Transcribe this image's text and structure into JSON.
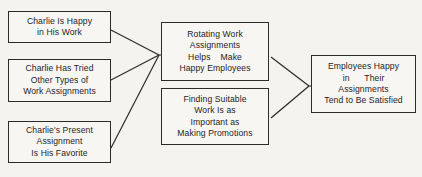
{
  "diagram": {
    "type": "flow-diagram",
    "title": "",
    "background_color": "#f4f3ef",
    "line_color": "#2b2b2b",
    "text_color": "#1d1d1d",
    "partial_top_text": "· · · · · ·",
    "nodes": [
      {
        "id": "evidence-1",
        "group": "evidence",
        "lines": [
          "Charlie Is Happy",
          "in His Work"
        ],
        "x": 8,
        "y": 11,
        "w": 103,
        "h": 32
      },
      {
        "id": "evidence-2",
        "group": "evidence",
        "lines": [
          "Charlie Has Tried",
          "Other Types of",
          "Work Assignments"
        ],
        "x": 8,
        "y": 59,
        "w": 103,
        "h": 43
      },
      {
        "id": "evidence-3",
        "group": "evidence",
        "lines": [
          "Charlie's Present",
          "Assignment",
          "Is His Favorite"
        ],
        "x": 8,
        "y": 121,
        "w": 103,
        "h": 42
      },
      {
        "id": "generalization-1",
        "group": "generalization",
        "lines": [
          "Rotating Work",
          "Assignments",
          "Helps    Make",
          "Happy Employees"
        ],
        "x": 161,
        "y": 22,
        "w": 108,
        "h": 59
      },
      {
        "id": "generalization-2",
        "group": "generalization",
        "lines": [
          "Finding Suitable",
          "Work Is as",
          "Important as",
          "Making Promotions"
        ],
        "x": 161,
        "y": 88,
        "w": 108,
        "h": 57
      },
      {
        "id": "conclusion",
        "group": "conclusion",
        "lines": [
          "Employees Happy",
          "in      Their",
          "Assignments",
          "Tend to Be Satisfied"
        ],
        "x": 311,
        "y": 55,
        "w": 105,
        "h": 58
      }
    ],
    "connectors": [
      {
        "id": "evidence1-to-junction-left",
        "from": "evidence-1",
        "to": "junction-left",
        "x1": 111,
        "y1": 30,
        "x2": 159,
        "y2": 55
      },
      {
        "id": "evidence2-to-junction-left",
        "from": "evidence-2",
        "to": "junction-left",
        "x1": 111,
        "y1": 80,
        "x2": 159,
        "y2": 55
      },
      {
        "id": "evidence3-to-junction-left",
        "from": "evidence-3",
        "to": "junction-left",
        "x1": 111,
        "y1": 148,
        "x2": 159,
        "y2": 55
      },
      {
        "id": "junction-left-to-generalization1",
        "from": "junction-left",
        "to": "generalization-1",
        "x1": 159,
        "y1": 55,
        "x2": 161,
        "y2": 55
      },
      {
        "id": "generalization1-to-junction-right",
        "from": "generalization-1",
        "to": "junction-right",
        "x1": 271,
        "y1": 57,
        "x2": 309,
        "y2": 86
      },
      {
        "id": "generalization2-to-junction-right",
        "from": "generalization-2",
        "to": "junction-right",
        "x1": 271,
        "y1": 118,
        "x2": 309,
        "y2": 86
      },
      {
        "id": "junction-right-to-conclusion",
        "from": "junction-right",
        "to": "conclusion",
        "x1": 309,
        "y1": 86,
        "x2": 311,
        "y2": 86
      }
    ]
  }
}
